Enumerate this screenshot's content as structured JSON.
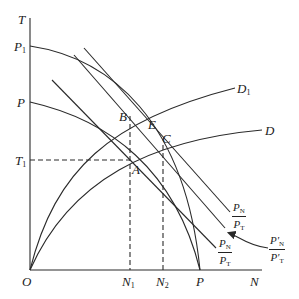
{
  "diagram": {
    "type": "production-possibility-frontier",
    "axes": {
      "y_label": "T",
      "x_label": "N",
      "origin_label": "O"
    },
    "y_axis_marks": [
      {
        "id": "P1",
        "base": "P",
        "sub": "1"
      },
      {
        "id": "P",
        "base": "P",
        "sub": ""
      },
      {
        "id": "T1",
        "base": "T",
        "sub": "1"
      }
    ],
    "x_axis_marks": [
      {
        "id": "N1",
        "base": "N",
        "sub": "1"
      },
      {
        "id": "N2",
        "base": "N",
        "sub": "2"
      },
      {
        "id": "P",
        "base": "P",
        "sub": ""
      }
    ],
    "points": {
      "A": "A",
      "B": "B",
      "C": "C",
      "E": "E"
    },
    "curves": {
      "D1": {
        "base": "D",
        "sub": "1"
      },
      "D": {
        "base": "D",
        "sub": ""
      }
    },
    "price_ratios": [
      {
        "id": "upper",
        "num_base": "P",
        "num_sub": "N",
        "den_base": "P",
        "den_sub": "T",
        "prime": false
      },
      {
        "id": "lower",
        "num_base": "P",
        "num_sub": "N",
        "den_base": "P",
        "den_sub": "T",
        "prime": false
      },
      {
        "id": "arrow",
        "num_base": "P'",
        "num_sub": "N",
        "den_base": "P'",
        "den_sub": "T",
        "prime": true
      }
    ],
    "line_color": "#2a2a2a"
  }
}
